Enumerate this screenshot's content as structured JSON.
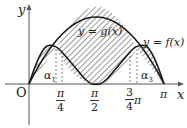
{
  "diagram": {
    "axes": {
      "x_label": "x",
      "y_label": "y",
      "origin_label": "O"
    },
    "curves": {
      "g_label": "y = g(x)",
      "f_label": "y = f(x)"
    },
    "x_ticks": [
      {
        "num": "π",
        "den": "4"
      },
      {
        "num": "π",
        "den": "2"
      },
      {
        "num": "3",
        "den": "4",
        "suffix": "π"
      },
      {
        "text": "π"
      }
    ],
    "intersections": {
      "alpha1": "α",
      "alpha1_sub": "1",
      "alpha3": "α",
      "alpha3_sub": "3"
    },
    "colors": {
      "line": "#1a1a1a",
      "axis": "#555555",
      "hatch": "#333333",
      "dash": "#666666"
    }
  }
}
